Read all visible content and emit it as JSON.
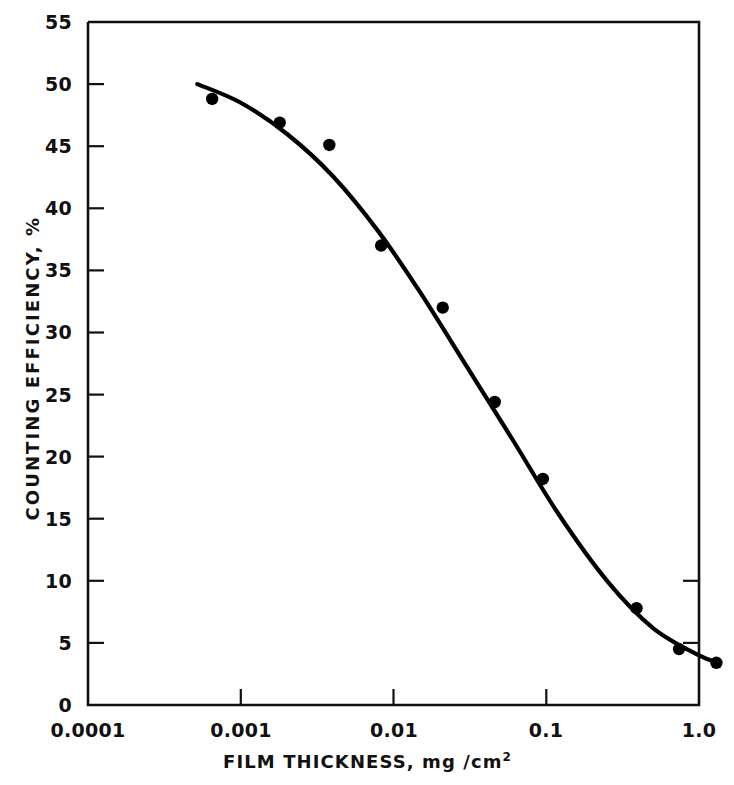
{
  "chart_data": {
    "type": "scatter",
    "title": "",
    "xlabel": "FILM THICKNESS, mg /cm",
    "xlabel_exponent": "2",
    "ylabel": "COUNTING EFFICIENCY, %",
    "xscale": "log",
    "yscale": "linear",
    "xlim": [
      0.0001,
      1.0
    ],
    "ylim": [
      0,
      55
    ],
    "grid": false,
    "legend": null,
    "xticks": [
      0.0001,
      0.001,
      0.01,
      0.1,
      1.0
    ],
    "xtick_labels": [
      "0.0001",
      "0.001",
      "0.01",
      "0.1",
      "1.0"
    ],
    "yticks": [
      0,
      5,
      10,
      15,
      20,
      25,
      30,
      35,
      40,
      45,
      50,
      55
    ],
    "ytick_labels": [
      "0",
      "5",
      "10",
      "15",
      "20",
      "25",
      "30",
      "35",
      "40",
      "45",
      "50",
      "55"
    ],
    "series": [
      {
        "name": "measured counting efficiency",
        "marker": "filled-circle",
        "marker_color": "#000000",
        "x": [
          0.00065,
          0.0018,
          0.0038,
          0.0083,
          0.021,
          0.046,
          0.095,
          0.39,
          0.74,
          1.3
        ],
        "y": [
          48.8,
          46.9,
          45.1,
          37.0,
          32.0,
          24.4,
          18.2,
          7.8,
          4.5,
          3.4
        ]
      },
      {
        "name": "fitted curve",
        "marker": "none",
        "line_color": "#000000",
        "x": [
          0.00052,
          0.001,
          0.002,
          0.004,
          0.008,
          0.015,
          0.03,
          0.06,
          0.12,
          0.25,
          0.5,
          1.0,
          1.35
        ],
        "y": [
          50.0,
          48.5,
          46.0,
          42.6,
          38.1,
          33.2,
          27.3,
          21.4,
          15.4,
          10.0,
          6.2,
          4.0,
          3.4
        ]
      }
    ]
  },
  "axes": {
    "frame_color": "#111111"
  }
}
